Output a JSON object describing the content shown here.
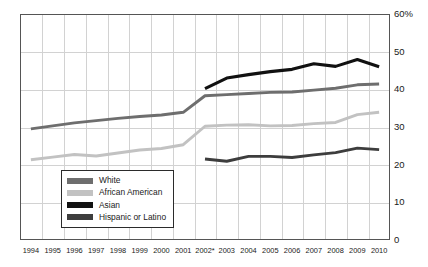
{
  "chart_data": {
    "type": "line",
    "title": "",
    "subtitle": "",
    "xlabel": "",
    "ylabel": "",
    "ylim": [
      0,
      60
    ],
    "y_unit": "%",
    "grid": true,
    "legend_position": "inside-bottom-left",
    "note": "2002* indicates a break in the data series; Asian and Hispanic or Latino series begin in 2002.",
    "categories": [
      "1994",
      "1995",
      "1996",
      "1997",
      "1998",
      "1999",
      "2000",
      "2001",
      "2002*",
      "2003",
      "2004",
      "2005",
      "2006",
      "2007",
      "2008",
      "2009",
      "2010"
    ],
    "yticks": [
      "0",
      "10",
      "20",
      "30",
      "40",
      "50",
      "60%"
    ],
    "ytick_values": [
      0,
      10,
      20,
      30,
      40,
      50,
      60
    ],
    "series": [
      {
        "name": "White",
        "color": "#6e6e6e",
        "values": [
          29.5,
          30.3,
          31.1,
          31.7,
          32.3,
          32.8,
          33.2,
          33.9,
          38.3,
          38.6,
          38.9,
          39.2,
          39.3,
          39.8,
          40.3,
          41.2,
          41.4
        ]
      },
      {
        "name": "African American",
        "color": "#c2c2c2",
        "values": [
          21.3,
          22.0,
          22.7,
          22.3,
          23.1,
          23.9,
          24.3,
          25.3,
          30.2,
          30.5,
          30.6,
          30.3,
          30.4,
          30.9,
          31.2,
          33.3,
          33.9
        ]
      },
      {
        "name": "Asian",
        "color": "#111111",
        "values": [
          null,
          null,
          null,
          null,
          null,
          null,
          null,
          null,
          40.2,
          43.0,
          43.9,
          44.7,
          45.3,
          46.8,
          46.1,
          47.9,
          46.0
        ]
      },
      {
        "name": "Hispanic or Latino",
        "color": "#3d3d3d",
        "values": [
          null,
          null,
          null,
          null,
          null,
          null,
          null,
          null,
          21.5,
          20.9,
          22.2,
          22.2,
          21.9,
          22.6,
          23.2,
          24.4,
          24.0
        ]
      }
    ]
  },
  "legend": {
    "items": [
      {
        "label": "White",
        "color": "#6e6e6e"
      },
      {
        "label": "African American",
        "color": "#c2c2c2"
      },
      {
        "label": "Asian",
        "color": "#111111"
      },
      {
        "label": "Hispanic or Latino",
        "color": "#3d3d3d"
      }
    ]
  },
  "axis": {
    "y_labels": [
      "60%",
      "50",
      "40",
      "30",
      "20",
      "10",
      "0"
    ],
    "x_labels": [
      "1994",
      "1995",
      "1996",
      "1997",
      "1998",
      "1999",
      "2000",
      "2001",
      "2002*",
      "2003",
      "2004",
      "2005",
      "2006",
      "2007",
      "2008",
      "2009",
      "2010"
    ]
  },
  "colors": {
    "frame": "#555555",
    "grid": "#d2d2d2",
    "background": "#ffffff",
    "text": "#1a1a1a"
  }
}
